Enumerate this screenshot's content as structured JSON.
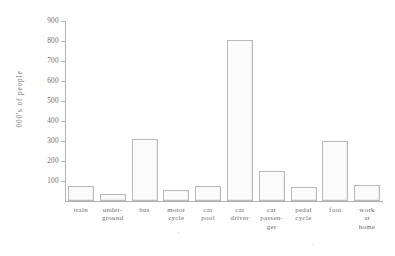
{
  "chart_data": {
    "type": "bar",
    "title": "",
    "xlabel": "",
    "ylabel": "000's of people",
    "ylim": [
      0,
      900
    ],
    "ytick_step": 100,
    "yticks": [
      900,
      800,
      700,
      600,
      500,
      400,
      300,
      200,
      100
    ],
    "grid": false,
    "legend": false,
    "categories": [
      "train",
      "under-\nground",
      "bus",
      "motor\ncycle",
      "car\npool",
      "car\ndriver",
      "car\npassen-\nger",
      "pedal\ncycle",
      "foot",
      "work\nat\nhome"
    ],
    "values": [
      75,
      35,
      310,
      55,
      75,
      805,
      150,
      70,
      300,
      80
    ],
    "bar_fill": "#fbfbfb",
    "bar_stroke": "#b9b9b9",
    "axis_color": "#b4b4b4",
    "text_color": "#6a6a6a",
    "background": "#ffffff"
  }
}
